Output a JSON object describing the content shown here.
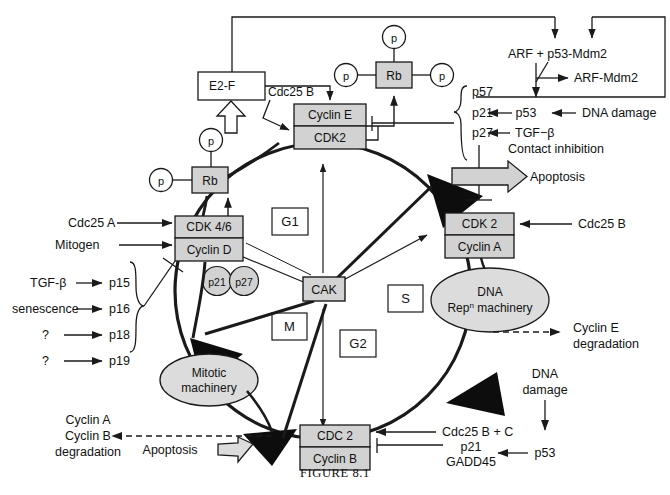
{
  "figure": {
    "caption": "FIGURE 8.1"
  },
  "colors": {
    "box_fill": "#d2d2d2",
    "box_stroke": "#1a1a1a",
    "ellipse_fill": "#dcdcdc",
    "line": "#1a1a1a",
    "text": "#111111",
    "white": "#ffffff"
  },
  "cycle_nodes": [
    {
      "id": "cdk46",
      "top": "CDK 4/6",
      "bottom": "Cyclin D"
    },
    {
      "id": "cyclinE",
      "top": "Cyclin E",
      "bottom": "CDK2"
    },
    {
      "id": "cdk2a",
      "top": "CDK 2",
      "bottom": "Cyclin A"
    },
    {
      "id": "cdc2",
      "top": "CDC 2",
      "bottom": "Cyclin B"
    }
  ],
  "central": {
    "label": "CAK"
  },
  "phases": [
    {
      "id": "g1",
      "label": "G1"
    },
    {
      "id": "s",
      "label": "S"
    },
    {
      "id": "g2",
      "label": "G2"
    },
    {
      "id": "m",
      "label": "M"
    }
  ],
  "ellipses": [
    {
      "id": "dna-rep",
      "line1": "DNA",
      "line2": "Rep",
      "sup": "n",
      "line2b": " machinery"
    },
    {
      "id": "mitotic",
      "line1": "Mitotic",
      "line2": "machinery"
    }
  ],
  "rb_nodes": [
    {
      "id": "rb-left",
      "label": "Rb",
      "phosphates": [
        "p",
        "p"
      ]
    },
    {
      "id": "rb-top",
      "label": "Rb",
      "phosphates": [
        "p",
        "p",
        "p"
      ]
    }
  ],
  "inhibitor_circles": [
    {
      "id": "p21-circle",
      "label": "p21"
    },
    {
      "id": "p27-circle",
      "label": "p27"
    }
  ],
  "boxes": {
    "e2f": "E2-F"
  },
  "labels": {
    "cdc25b_top": "Cdc25 B",
    "cdc25a": "Cdc25 A",
    "mitogen": "Mitogen",
    "cdc25b_right": "Cdc25 B",
    "cdc25bc": "Cdc25 B + C",
    "apoptosis_right": "Apoptosis",
    "apoptosis_left": "Apoptosis",
    "arf_p53_mdm2": "ARF  + p53-Mdm2",
    "arf_mdm2": "ARF-Mdm2",
    "p53_right": "p53",
    "dna_damage_right": "DNA damage",
    "tgfb_right": "TGF−β",
    "contact_inhibition": "Contact inhibition",
    "dna_damage_bottom_1": "DNA",
    "dna_damage_bottom_2": "damage",
    "p53_bottom": "p53",
    "p21_bottom": "p21",
    "gadd45": "GADD45",
    "cyclinE_deg_1": "Cyclin E",
    "cyclinE_deg_2": "degradation",
    "cyclinAB_deg_1": "Cyclin A",
    "cyclinAB_deg_2": "Cyclin B",
    "cyclinAB_deg_3": "degradation"
  },
  "cki_brace_right": [
    {
      "label": "p57"
    },
    {
      "label": "p21"
    },
    {
      "label": "p27"
    }
  ],
  "cki_brace_left": [
    {
      "stimulus": "TGF-β",
      "label": "p15"
    },
    {
      "stimulus": "senescence",
      "label": "p16"
    },
    {
      "stimulus": "?",
      "label": "p18"
    },
    {
      "stimulus": "?",
      "label": "p19"
    }
  ]
}
